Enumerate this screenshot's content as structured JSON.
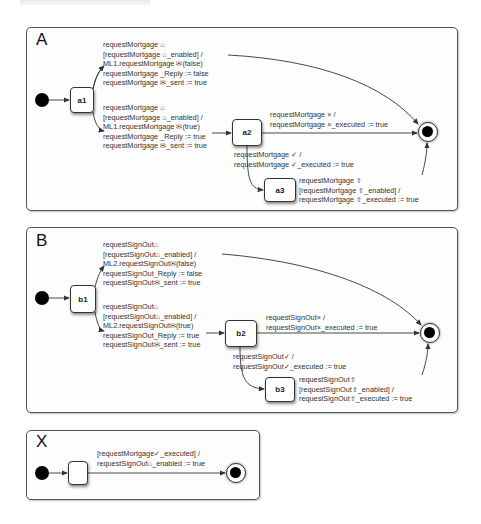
{
  "page_header": "",
  "diagrams": {
    "A": {
      "title": "A",
      "states": {
        "s1": "a1",
        "s2": "a2",
        "s3": "a3"
      },
      "transitions": {
        "s1_to_final": [
          "requestMortgage ⌂",
          "[requestMortgage ⌂_enabled] /",
          "ML1.requestMortgage ✉(false)",
          "requestMortgage _Reply := false",
          "requestMortgage ✉_sent := true"
        ],
        "s1_to_s2": [
          "requestMortgage ⌂",
          "[requestMortgage ⌂_enabled] /",
          "ML1.requestMortgage ✉(true)",
          "requestMortgage _Reply := true",
          "requestMortgage ✉_sent := true"
        ],
        "s2_to_final": [
          "requestMortgage × /",
          "requestMortgage ×_executed := true"
        ],
        "s2_to_s3": [
          "requestMortgage ✓ /",
          "requestMortgage ✓_executed := true"
        ],
        "s3_to_final": [
          "requestMortgage ⇧",
          "[requestMortgage ⇧_enabled] /",
          "requestMortgage ⇧_executed := true"
        ]
      }
    },
    "B": {
      "title": "B",
      "states": {
        "s1": "b1",
        "s2": "b2",
        "s3": "b3"
      },
      "transitions": {
        "s1_to_final": [
          "requestSignOut⌂",
          "[requestSignOut⌂_enabled] /",
          "ML2.requestSignOut✉(false)",
          "requestSignOut_Reply := false",
          "requestSignOut✉_sent := true"
        ],
        "s1_to_s2": [
          "requestSignOut⌂",
          "[requestSignOut⌂_enabled] /",
          "ML2.requestSignOut✉(true)",
          "requestSignOut_Reply := true",
          "requestSignOut✉_sent := true"
        ],
        "s2_to_final": [
          "requestSignOut× /",
          "requestSignOut×_executed := true"
        ],
        "s2_to_s3": [
          "requestSignOut✓ /",
          "requestSignOut✓_executed := true"
        ],
        "s3_to_final": [
          "requestSignOut⇧",
          "[requestSignOut⇧_enabled] /",
          "requestSignOut⇧_executed := true"
        ]
      }
    },
    "X": {
      "title": "X",
      "states": {
        "s1": ""
      },
      "transitions": {
        "s1_to_final": [
          "[requestMortgage✓_executed] /",
          "requestSignOut⌂_enabled := true"
        ]
      }
    }
  },
  "colors": {
    "line": "#333333",
    "panel_border": "#555555",
    "dot": "#000000"
  }
}
